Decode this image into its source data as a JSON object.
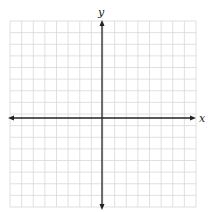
{
  "diagram": {
    "type": "coordinate-plane",
    "x_axis_label": "x",
    "y_axis_label": "y",
    "grid": {
      "columns": 16,
      "rows": 16,
      "cell_px": 11.6,
      "left": 10,
      "top": 21,
      "right": 196,
      "bottom": 207
    },
    "origin_px": {
      "x": 102,
      "y": 118
    },
    "colors": {
      "grid": "#d8d8d8",
      "axis": "#222222",
      "background": "#ffffff"
    }
  }
}
